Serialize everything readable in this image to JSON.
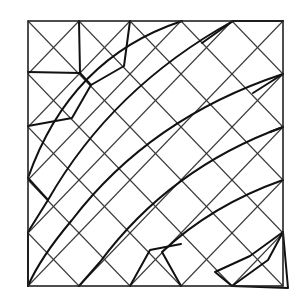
{
  "diagram": {
    "type": "mesh",
    "colors": {
      "background": "#ffffff",
      "lines": "#111111",
      "lattice": "#3a3a3a"
    },
    "frame": {
      "left": 28,
      "top": 21,
      "right": 283,
      "bottom": 286
    },
    "grid": {
      "columns": 5,
      "rows": 5
    },
    "arcs": [
      "M182,21 Q70,58 28,178",
      "M233,21 Q112,88 48,200 L28,232",
      "M283,74 Q150,118 72,220 Q40,258 28,286",
      "M283,127 Q170,168 100,262 L79,286",
      "M283,180 Q212,205 162,252 L181,286",
      "M283,232 L268,260 L232,286"
    ],
    "transition_edges": [
      "M79,21 L80,73 L28,72",
      "M80,73 L91,85",
      "M130,21 L124,66 L91,85 L72,118 L28,126",
      "M233,21 L202,43",
      "M233,21 L283,21",
      "M283,74 L253,93",
      "M283,127 L270,132",
      "M28,286 L28,232",
      "M48,200 L28,178",
      "M130,286 L150,250 L181,244",
      "M232,286 L215,272 L250,256 L283,232",
      "M283,232 L288,288 L232,286"
    ]
  }
}
